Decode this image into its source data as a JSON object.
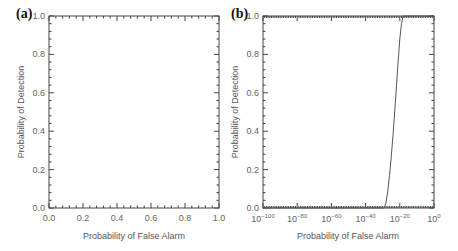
{
  "chart_data": [
    {
      "panel": "(a)",
      "type": "line",
      "title": "",
      "xlabel": "Probability of False Alarm",
      "ylabel": "Probability of Detection",
      "xscale": "linear",
      "xlim": [
        0.0,
        1.0
      ],
      "ylim": [
        0.0,
        1.0
      ],
      "xticks": [
        "0.0",
        "0.2",
        "0.4",
        "0.6",
        "0.8",
        "1.0"
      ],
      "yticks": [
        "0.0",
        "0.2",
        "0.4",
        "0.6",
        "0.8",
        "1.0"
      ],
      "grid": false,
      "series": [
        {
          "name": "ROC",
          "x": [
            0.0,
            0.0,
            1.0
          ],
          "y": [
            0.0,
            1.0,
            1.0
          ],
          "note": "curve coincides with left and top axes"
        }
      ]
    },
    {
      "panel": "(b)",
      "type": "line",
      "title": "",
      "xlabel": "Probability of False Alarm",
      "ylabel": "Probability of Detection",
      "xscale": "log",
      "xlim": [
        "1e-100",
        "1e0"
      ],
      "ylim": [
        0.0,
        1.0
      ],
      "xticks": [
        "10^-100",
        "10^-80",
        "10^-60",
        "10^-40",
        "10^-20",
        "10^0"
      ],
      "yticks": [
        "0.0",
        "0.2",
        "0.4",
        "0.6",
        "0.8",
        "1.0"
      ],
      "grid": false,
      "series": [
        {
          "name": "ROC",
          "log10_x": [
            -100,
            -29,
            -28,
            -27,
            -26,
            -25,
            -24,
            -23,
            -22,
            -21,
            -20,
            -19,
            -18,
            0
          ],
          "y": [
            0.0,
            0.0,
            0.03,
            0.09,
            0.17,
            0.27,
            0.38,
            0.5,
            0.63,
            0.76,
            0.88,
            0.96,
            1.0,
            1.0
          ]
        }
      ]
    }
  ],
  "panels": {
    "a": {
      "label": "(a)",
      "xlabel": "Probability of False Alarm",
      "ylabel": "Probability of Detection",
      "yticks": [
        "0.0",
        "0.2",
        "0.4",
        "0.6",
        "0.8",
        "1.0"
      ],
      "xticks": [
        "0.0",
        "0.2",
        "0.4",
        "0.6",
        "0.8",
        "1.0"
      ]
    },
    "b": {
      "label": "(b)",
      "xlabel": "Probability of False Alarm",
      "ylabel": "Probability of Detection",
      "yticks": [
        "0.0",
        "0.2",
        "0.4",
        "0.6",
        "0.8",
        "1.0"
      ],
      "xtick_base": "10",
      "xtick_exponents": [
        "−100",
        "−80",
        "−60",
        "−40",
        "−20",
        "0"
      ]
    }
  }
}
